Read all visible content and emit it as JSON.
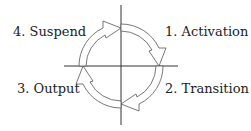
{
  "diagram": {
    "type": "cycle",
    "direction": "clockwise",
    "stages": [
      {
        "id": 1,
        "label": "1. Activation",
        "quadrant": "top-right"
      },
      {
        "id": 2,
        "label": "2. Transition",
        "quadrant": "bottom-right"
      },
      {
        "id": 3,
        "label": "3. Output",
        "quadrant": "bottom-left"
      },
      {
        "id": 4,
        "label": "4. Suspend",
        "quadrant": "top-left"
      }
    ],
    "colors": {
      "stroke": "#333333",
      "fill": "#ffffff"
    }
  }
}
